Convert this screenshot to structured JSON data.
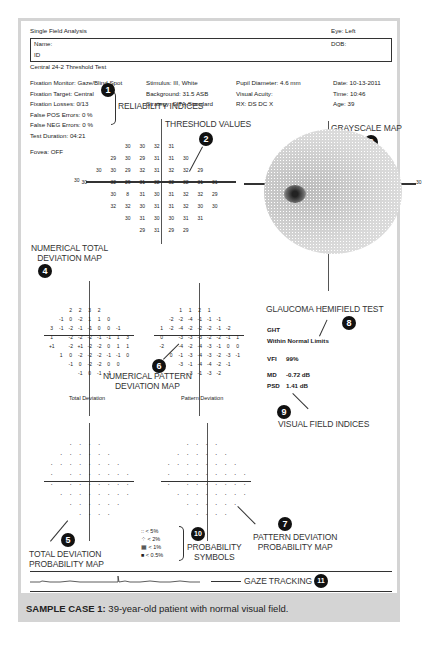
{
  "report": {
    "title": "Single Field Analysis",
    "eye": "Eye: Left",
    "name_label": "Name:",
    "dob_label": "DOB:",
    "id_label": "ID",
    "test_name": "Central 24-2 Threshold Test"
  },
  "params": {
    "col1": [
      "Fixation Monitor: Gaze/Blind Spot",
      "Fixation Target: Central",
      "Fixation Losses: 0/13",
      "False POS Errors:  0 %",
      "False NEG Errors:  0 %",
      "Test Duration: 04:21"
    ],
    "fovea": "Fovea: OFF",
    "col2": [
      "Stimulus: III, White",
      "Background: 31.5 ASB",
      "Strategy: SITA-Standard"
    ],
    "col3": [
      "Pupil Diameter: 4.6 mm",
      "Visual Acuity:",
      "RX:     DS     DC X"
    ],
    "col4": [
      "Date: 10-13-2011",
      "Time: 10:46",
      "Age: 39"
    ]
  },
  "annotations": {
    "a1": {
      "num": "1",
      "label": "RELIABILITY INDICES"
    },
    "a2": {
      "num": "2",
      "label": "THRESHOLD VALUES"
    },
    "a3": {
      "num": "3",
      "label": "GRAYSCALE MAP"
    },
    "a4": {
      "num": "4",
      "label_l1": "NUMERICAL TOTAL",
      "label_l2": "DEVIATION MAP"
    },
    "a5": {
      "num": "5",
      "label_l1": "TOTAL DEVIATION",
      "label_l2": "PROBABILITY MAP"
    },
    "a6": {
      "num": "6",
      "label_l1": "NUMERICAL PATTERN",
      "label_l2": "DEVIATION MAP"
    },
    "a7": {
      "num": "7",
      "label_l1": "PATTERN DEVIATION",
      "label_l2": "PROBABILITY MAP"
    },
    "a8": {
      "num": "8",
      "label": "GLAUCOMA HEMIFIELD TEST"
    },
    "a9": {
      "num": "9",
      "label": "VISUAL FIELD INDICES"
    },
    "a10": {
      "num": "10",
      "label_l1": "PROBABILITY",
      "label_l2": "SYMBOLS"
    },
    "a11": {
      "num": "11",
      "label": "GAZE TRACKING"
    }
  },
  "threshold": {
    "axis_label_left": "30",
    "rows": [
      [
        "",
        "",
        "",
        "30",
        "30",
        "32",
        "31",
        "",
        "",
        ""
      ],
      [
        "",
        "",
        "29",
        "30",
        "29",
        "31",
        "31",
        "30",
        "",
        ""
      ],
      [
        "",
        "30",
        "30",
        "29",
        "32",
        "31",
        "32",
        "32",
        "29",
        ""
      ],
      [
        "30",
        "",
        "32",
        "29",
        "31",
        "32",
        "32",
        "32",
        "31",
        "31"
      ],
      [
        "",
        "",
        "30",
        "8",
        "31",
        "30",
        "31",
        "32",
        "32",
        "29"
      ],
      [
        "",
        "",
        "32",
        "32",
        "30",
        "31",
        "31",
        "32",
        "30",
        "30"
      ],
      [
        "",
        "",
        "",
        "30",
        "31",
        "30",
        "30",
        "31",
        "31",
        ""
      ],
      [
        "",
        "",
        "",
        "",
        "29",
        "31",
        "29",
        "29",
        "",
        ""
      ]
    ]
  },
  "grayscale": {
    "axis_label_right": "30"
  },
  "total_deviation": {
    "title": "Total Deviation",
    "rows": [
      [
        "",
        "",
        "2",
        "2",
        "3",
        "2",
        "",
        ""
      ],
      [
        "",
        "-1",
        "0",
        "-2",
        "1",
        "1",
        "0",
        ""
      ],
      [
        "3",
        "-1",
        "-2",
        "-1",
        "-1",
        "0",
        "0",
        "-1"
      ],
      [
        "1",
        "",
        "-2",
        "-2",
        "-2",
        "-1",
        "-1",
        "1",
        "3"
      ],
      [
        "+1",
        "",
        "-2",
        "+1",
        "-2",
        "-2",
        "0",
        "1",
        "1"
      ],
      [
        "",
        "1",
        "0",
        "-2",
        "-2",
        "-2",
        "-1",
        "-1",
        "0"
      ],
      [
        "",
        "",
        "-1",
        "0",
        "-2",
        "-2",
        "0",
        "0"
      ],
      [
        "",
        "",
        "",
        "-1",
        "0",
        "-1",
        "-1",
        ""
      ]
    ]
  },
  "pattern_deviation": {
    "title": "Pattern Deviation",
    "rows": [
      [
        "",
        "",
        "1",
        "1",
        "2",
        "1",
        "",
        ""
      ],
      [
        "",
        "-2",
        "-2",
        "-4",
        "-1",
        "-1",
        "-1",
        ""
      ],
      [
        "1",
        "-2",
        "-4",
        "-2",
        "-2",
        "-2",
        "-1",
        "-2"
      ],
      [
        "0",
        "",
        "-3",
        "-3",
        "-3",
        "-2",
        "-2",
        "-1",
        "1"
      ],
      [
        "-2",
        "",
        "-4",
        "-2",
        "-4",
        "-3",
        "-1",
        "0",
        "0"
      ],
      [
        "",
        "0",
        "-1",
        "-3",
        "-4",
        "-3",
        "-2",
        "-3",
        "-1"
      ],
      [
        "",
        "",
        "-3",
        "-1",
        "-4",
        "-4",
        "-2",
        "-1"
      ],
      [
        "",
        "",
        "",
        "-3",
        "-1",
        "-3",
        "-2",
        ""
      ]
    ]
  },
  "ght": {
    "label": "GHT",
    "value": "Within Normal Limits"
  },
  "indices": {
    "vfi_label": "VFI",
    "vfi_value": "99%",
    "md_label": "MD",
    "md_value": "-0.72 dB",
    "psd_label": "PSD",
    "psd_value": "1.41 dB"
  },
  "legend": {
    "items": [
      {
        "symbol": "::",
        "label": "< 5%"
      },
      {
        "symbol": "⁘",
        "label": "< 2%"
      },
      {
        "symbol": "▦",
        "label": "< 1%"
      },
      {
        "symbol": "■",
        "label": "< 0.5%"
      }
    ]
  },
  "caption": {
    "bold": "SAMPLE CASE 1:",
    "text": " 39-year-old patient with normal visual field."
  }
}
